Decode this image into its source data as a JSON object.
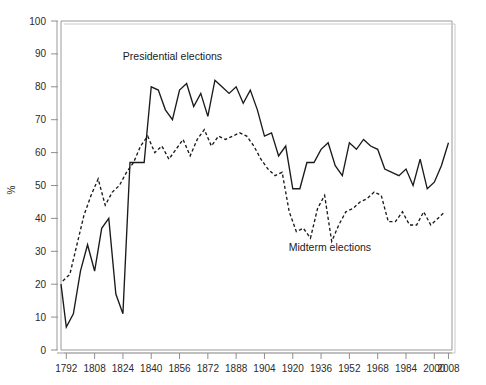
{
  "chart_data": {
    "type": "line",
    "title": "",
    "xlabel": "",
    "ylabel": "%",
    "xlim": [
      1789,
      2010
    ],
    "ylim": [
      0,
      100
    ],
    "grid": false,
    "legend_position": "inline-annotation",
    "y_ticks": [
      0,
      10,
      20,
      30,
      40,
      50,
      60,
      70,
      80,
      90,
      100
    ],
    "y_tick_labels": [
      "0",
      "10",
      "20",
      "30",
      "40",
      "50",
      "60",
      "70",
      "80",
      "90",
      "100"
    ],
    "x_ticks": [
      1792,
      1808,
      1824,
      1840,
      1856,
      1872,
      1888,
      1904,
      1920,
      1936,
      1952,
      1968,
      1984,
      2000,
      2008
    ],
    "x_tick_labels": [
      "1792",
      "1808",
      "1824",
      "1840",
      "1856",
      "1872",
      "1888",
      "1904",
      "1920",
      "1936",
      "1952",
      "1968",
      "1984",
      "2000",
      "2008"
    ],
    "annotations": [
      {
        "text": "Presidential elections",
        "x": 1852,
        "y": 88
      },
      {
        "text": "Midterm elections",
        "x": 1941,
        "y": 30
      }
    ],
    "series": [
      {
        "name": "Presidential elections",
        "style": "solid",
        "color": "#1a1a1a",
        "x": [
          1789,
          1792,
          1796,
          1800,
          1804,
          1808,
          1812,
          1816,
          1820,
          1824,
          1828,
          1832,
          1836,
          1840,
          1844,
          1848,
          1852,
          1856,
          1860,
          1864,
          1868,
          1872,
          1876,
          1880,
          1884,
          1888,
          1892,
          1896,
          1900,
          1904,
          1908,
          1912,
          1916,
          1920,
          1924,
          1928,
          1932,
          1936,
          1940,
          1944,
          1948,
          1952,
          1956,
          1960,
          1964,
          1968,
          1972,
          1976,
          1980,
          1984,
          1988,
          1992,
          1996,
          2000,
          2004,
          2008
        ],
        "y": [
          20,
          7,
          11,
          24,
          32,
          24,
          37,
          40,
          17,
          11,
          57,
          57,
          57,
          80,
          79,
          73,
          70,
          79,
          81,
          74,
          78,
          71,
          82,
          80,
          78,
          80,
          75,
          79,
          73,
          65,
          66,
          59,
          62,
          49,
          49,
          57,
          57,
          61,
          63,
          56,
          53,
          63,
          61,
          64,
          62,
          61,
          55,
          54,
          53,
          55,
          50,
          58,
          49,
          51,
          56,
          63
        ]
      },
      {
        "name": "Midterm elections",
        "style": "dashed",
        "color": "#1a1a1a",
        "x": [
          1790,
          1794,
          1798,
          1802,
          1806,
          1810,
          1814,
          1818,
          1822,
          1826,
          1830,
          1834,
          1838,
          1842,
          1846,
          1850,
          1854,
          1858,
          1862,
          1866,
          1870,
          1874,
          1878,
          1882,
          1886,
          1890,
          1894,
          1898,
          1902,
          1906,
          1910,
          1914,
          1918,
          1922,
          1926,
          1930,
          1934,
          1938,
          1942,
          1946,
          1950,
          1954,
          1958,
          1962,
          1966,
          1970,
          1974,
          1978,
          1982,
          1986,
          1990,
          1994,
          1998,
          2002,
          2006
        ],
        "y": [
          21,
          23,
          32,
          41,
          47,
          52,
          44,
          48,
          50,
          54,
          57,
          62,
          65,
          60,
          62,
          58,
          61,
          64,
          59,
          64,
          67,
          62,
          65,
          64,
          65,
          66,
          65,
          62,
          58,
          55,
          53,
          54,
          42,
          36,
          37,
          34,
          43,
          47,
          33,
          38,
          42,
          43,
          45,
          46,
          48,
          47,
          39,
          39,
          42,
          38,
          38,
          42,
          38,
          40,
          42
        ]
      }
    ]
  },
  "axis": {
    "y_title": "%"
  }
}
